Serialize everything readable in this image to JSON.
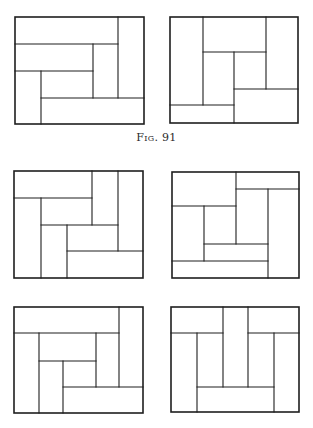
{
  "caption": {
    "prefix": "Fig.",
    "number": "91"
  },
  "style": {
    "stroke": "#1e1e1e",
    "outer_stroke_width": 1.6,
    "inner_stroke_width": 1.1,
    "background": "#ffffff"
  },
  "figures": [
    {
      "id": "fig-top-left",
      "outer": {
        "x1": 15,
        "y1": 17,
        "x2": 144,
        "y2": 124
      },
      "lines": [
        [
          118,
          17,
          118,
          98
        ],
        [
          15,
          44,
          118,
          44
        ],
        [
          93,
          44,
          93,
          98
        ],
        [
          15,
          71,
          93,
          71
        ],
        [
          41,
          71,
          41,
          124
        ],
        [
          41,
          98,
          144,
          98
        ]
      ]
    },
    {
      "id": "fig-top-right",
      "outer": {
        "x1": 170,
        "y1": 17,
        "x2": 298,
        "y2": 123
      },
      "lines": [
        [
          203,
          17,
          203,
          105
        ],
        [
          266,
          17,
          266,
          89
        ],
        [
          203,
          52,
          266,
          52
        ],
        [
          234,
          52,
          234,
          123
        ],
        [
          234,
          89,
          298,
          89
        ],
        [
          170,
          105,
          234,
          105
        ]
      ]
    },
    {
      "id": "fig-middle-left",
      "outer": {
        "x1": 14,
        "y1": 171,
        "x2": 143,
        "y2": 278
      },
      "lines": [
        [
          14,
          198,
          92,
          198
        ],
        [
          92,
          171,
          92,
          225
        ],
        [
          118,
          171,
          118,
          251
        ],
        [
          41,
          198,
          41,
          278
        ],
        [
          41,
          225,
          118,
          225
        ],
        [
          67,
          225,
          67,
          278
        ],
        [
          67,
          251,
          143,
          251
        ]
      ]
    },
    {
      "id": "fig-middle-right",
      "outer": {
        "x1": 172,
        "y1": 172,
        "x2": 299,
        "y2": 278
      },
      "lines": [
        [
          236,
          172,
          236,
          244
        ],
        [
          236,
          189,
          299,
          189
        ],
        [
          268,
          189,
          268,
          278
        ],
        [
          172,
          206,
          236,
          206
        ],
        [
          204,
          206,
          204,
          261
        ],
        [
          204,
          244,
          268,
          244
        ],
        [
          172,
          261,
          268,
          261
        ]
      ]
    },
    {
      "id": "fig-bottom-left",
      "outer": {
        "x1": 14,
        "y1": 307,
        "x2": 143,
        "y2": 413
      },
      "lines": [
        [
          119,
          307,
          119,
          387
        ],
        [
          14,
          333,
          119,
          333
        ],
        [
          39,
          333,
          39,
          413
        ],
        [
          96,
          333,
          96,
          387
        ],
        [
          39,
          361,
          96,
          361
        ],
        [
          63,
          361,
          63,
          413
        ],
        [
          63,
          387,
          143,
          387
        ]
      ]
    },
    {
      "id": "fig-bottom-right",
      "outer": {
        "x1": 171,
        "y1": 307,
        "x2": 299,
        "y2": 412
      },
      "lines": [
        [
          223,
          307,
          223,
          387
        ],
        [
          248,
          307,
          248,
          387
        ],
        [
          171,
          333,
          223,
          333
        ],
        [
          248,
          333,
          299,
          333
        ],
        [
          197,
          333,
          197,
          412
        ],
        [
          274,
          333,
          274,
          412
        ],
        [
          197,
          387,
          274,
          387
        ]
      ]
    }
  ]
}
